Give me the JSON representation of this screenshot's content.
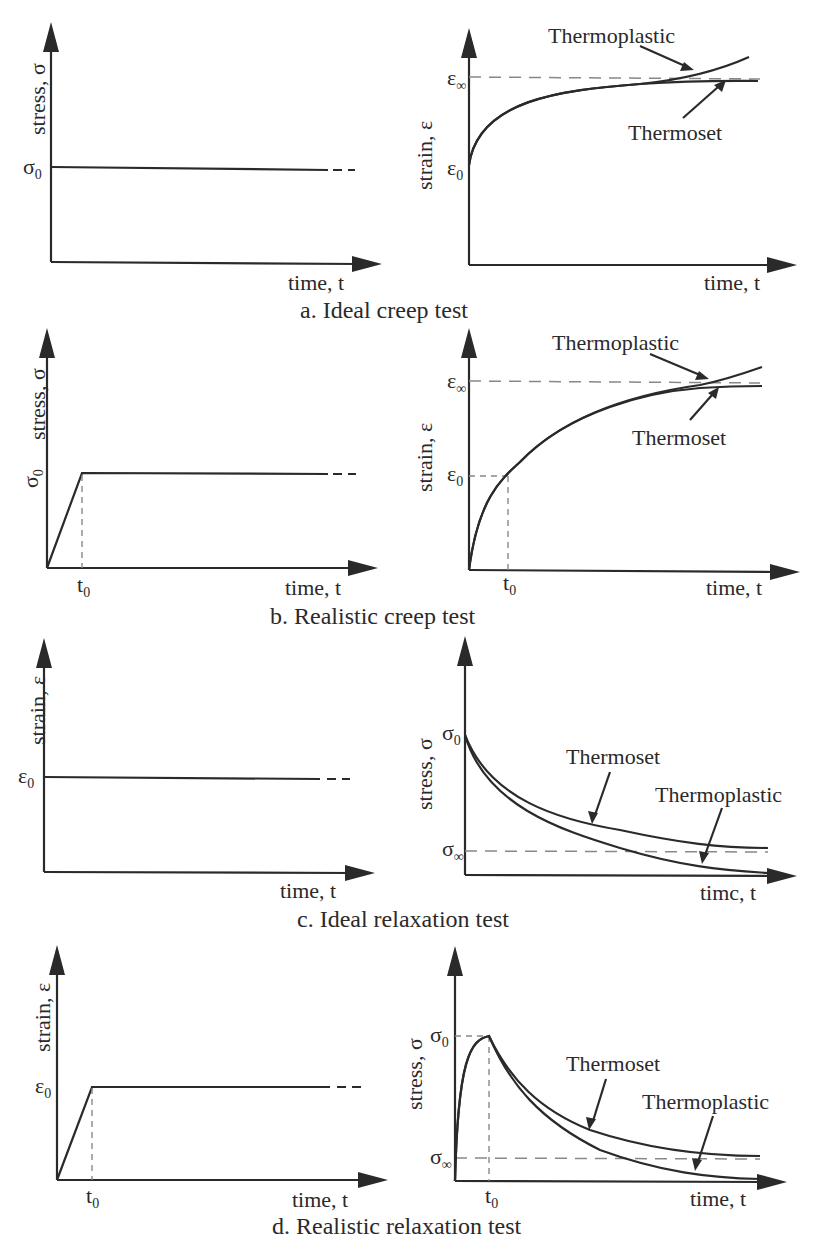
{
  "figure": {
    "panels": [
      {
        "id": "a",
        "caption": "a. Ideal creep test",
        "left": {
          "ylabel": "stress, σ",
          "xlabel": "time, t",
          "level_label": "σ",
          "level_sub": "0"
        },
        "right": {
          "ylabel": "strain, ε",
          "xlabel": "time, t",
          "top_label": "ε",
          "top_sub": "∞",
          "start_label": "ε",
          "start_sub": "0",
          "curve1": "Thermoplastic",
          "curve2": "Thermoset"
        }
      },
      {
        "id": "b",
        "caption": "b. Realistic creep test",
        "left": {
          "ylabel": "stress, σ",
          "xlabel": "time, t",
          "level_label": "σ",
          "level_sub": "0",
          "t0_label": "t",
          "t0_sub": "0"
        },
        "right": {
          "ylabel": "strain, ε",
          "xlabel": "time, t",
          "top_label": "ε",
          "top_sub": "∞",
          "start_label": "ε",
          "start_sub": "0",
          "t0_label": "t",
          "t0_sub": "0",
          "curve1": "Thermoplastic",
          "curve2": "Thermoset"
        }
      },
      {
        "id": "c",
        "caption": "c. Ideal relaxation test",
        "left": {
          "ylabel": "strain, ε",
          "xlabel": "time, t",
          "level_label": "ε",
          "level_sub": "0"
        },
        "right": {
          "ylabel": "stress, σ",
          "xlabel": "timc, t",
          "top_label": "σ",
          "top_sub": "0",
          "inf_label": "σ",
          "inf_sub": "∞",
          "curve1": "Thermoset",
          "curve2": "Thermoplastic"
        }
      },
      {
        "id": "d",
        "caption": "d. Realistic relaxation test",
        "left": {
          "ylabel": "strain, ε",
          "xlabel": "time, t",
          "level_label": "ε",
          "level_sub": "0",
          "t0_label": "t",
          "t0_sub": "0"
        },
        "right": {
          "ylabel": "stress, σ",
          "xlabel": "time, t",
          "top_label": "σ",
          "top_sub": "0",
          "inf_label": "σ",
          "inf_sub": "∞",
          "t0_label": "t",
          "t0_sub": "0",
          "curve1": "Thermoset",
          "curve2": "Thermoplastic"
        }
      }
    ]
  }
}
